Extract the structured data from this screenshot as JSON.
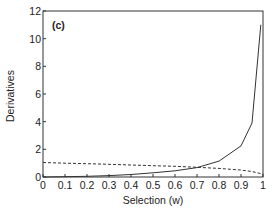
{
  "chart_data": {
    "type": "line",
    "title": "",
    "panel_label": "(c)",
    "xlabel": "Selection (w)",
    "ylabel": "Derivatives",
    "xlim": [
      0,
      1
    ],
    "ylim": [
      0,
      12
    ],
    "xticks": [
      0,
      0.1,
      0.2,
      0.3,
      0.4,
      0.5,
      0.6,
      0.7,
      0.8,
      0.9,
      1
    ],
    "xtick_labels": [
      "0",
      "0.1",
      "0.2",
      "0.3",
      "0.4",
      "0.5",
      "0.6",
      "0.7",
      "0.8",
      "0.9",
      "1"
    ],
    "yticks": [
      0,
      2,
      4,
      6,
      8,
      10,
      12
    ],
    "ytick_labels": [
      "0",
      "2",
      "4",
      "6",
      "8",
      "10",
      "12"
    ],
    "grid": false,
    "legend": null,
    "series": [
      {
        "name": "solid",
        "style": "solid",
        "x": [
          0,
          0.1,
          0.2,
          0.3,
          0.4,
          0.5,
          0.6,
          0.7,
          0.8,
          0.9,
          0.95,
          0.99
        ],
        "values": [
          0.0,
          0.02,
          0.05,
          0.1,
          0.18,
          0.3,
          0.45,
          0.68,
          1.15,
          2.25,
          3.9,
          11.0
        ]
      },
      {
        "name": "dashed",
        "style": "dashed",
        "x": [
          0,
          0.1,
          0.2,
          0.3,
          0.4,
          0.5,
          0.6,
          0.7,
          0.8,
          0.9,
          0.95,
          1.0
        ],
        "values": [
          1.05,
          1.0,
          0.96,
          0.92,
          0.87,
          0.82,
          0.77,
          0.7,
          0.62,
          0.5,
          0.4,
          0.2
        ]
      }
    ]
  }
}
